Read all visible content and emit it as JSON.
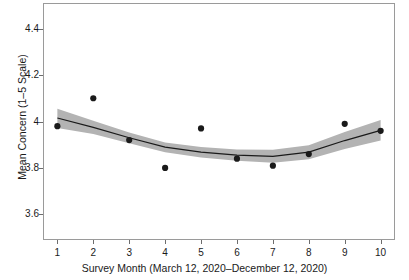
{
  "chart_data": {
    "type": "scatter",
    "title": "",
    "xlabel": "Survey Month (March 12, 2020–December 12, 2020)",
    "ylabel": "Mean Concern (1–5 Scale)",
    "x": [
      1,
      2,
      3,
      4,
      5,
      6,
      7,
      8,
      9,
      10
    ],
    "xtick_labels": [
      "1",
      "2",
      "3",
      "4",
      "5",
      "6",
      "7",
      "8",
      "9",
      "10"
    ],
    "ytick_labels": [
      "4.4",
      "4.2",
      "4",
      "3.8",
      "3.6"
    ],
    "ytick_values": [
      4.4,
      4.2,
      4.0,
      3.8,
      3.6
    ],
    "xlim": [
      0.6,
      10.4
    ],
    "ylim": [
      3.49,
      4.51
    ],
    "grid": false,
    "legend": null,
    "series": [
      {
        "name": "Observed mean concern",
        "marker": "filled-circle",
        "color": "#1a1a1a",
        "values": [
          3.98,
          4.1,
          3.92,
          3.8,
          3.97,
          3.84,
          3.81,
          3.86,
          3.99,
          3.96
        ]
      },
      {
        "name": "Smoothed trend (fit)",
        "marker": "line",
        "color": "#1a1a1a",
        "values": [
          4.015,
          3.975,
          3.93,
          3.89,
          3.868,
          3.855,
          3.85,
          3.868,
          3.918,
          3.962
        ]
      },
      {
        "name": "Confidence band (upper)",
        "marker": "band",
        "color": "#b3b3b3",
        "values": [
          4.055,
          4.003,
          3.953,
          3.91,
          3.89,
          3.879,
          3.878,
          3.898,
          3.955,
          4.006
        ]
      },
      {
        "name": "Confidence band (lower)",
        "marker": "band",
        "color": "#b3b3b3",
        "values": [
          3.972,
          3.946,
          3.906,
          3.868,
          3.845,
          3.831,
          3.822,
          3.838,
          3.882,
          3.918
        ]
      }
    ],
    "colors": {
      "point": "#1a1a1a",
      "line": "#1a1a1a",
      "band": "#b3b3b3",
      "axis": "#9a9a9a",
      "text": "#1a1a1a",
      "background": "#ffffff"
    }
  }
}
